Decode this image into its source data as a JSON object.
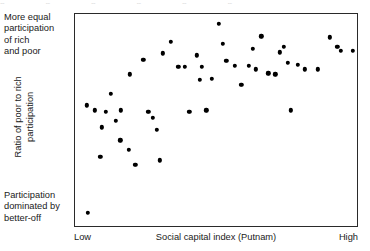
{
  "figure": {
    "top_crop_remnant": "p p p p p p",
    "y_axis": {
      "top_annotation": "More equal\nparticipation\nof rich\nand poor",
      "bottom_annotation": "Participation\ndominated by\nbetter-off",
      "rotated_title": "Ratio of poor to rich\nparticipation"
    },
    "x_axis": {
      "title": "Social capital index (Putnam)",
      "tick_low": "Low",
      "tick_high": "High"
    },
    "colors": {
      "frame": "#2a2a2a",
      "marker": "#000000",
      "text": "#1a1a1a",
      "background": "#ffffff"
    }
  },
  "chart_data": {
    "type": "scatter",
    "title": "",
    "xlabel": "Social capital index (Putnam)",
    "ylabel": "Ratio of poor to rich participation",
    "grid": false,
    "legend": false,
    "xlim": [
      0,
      100
    ],
    "ylim": [
      0,
      100
    ],
    "xtick_labels": [
      "Low",
      "High"
    ],
    "ytick_labels": [],
    "y_axis_annotations": {
      "high_end": "More equal participation of rich and poor",
      "low_end": "Participation dominated by better-off"
    },
    "series": [
      {
        "name": "US states",
        "marker": "dot",
        "color": "#000000",
        "points": [
          [
            4.2,
            57.0
          ],
          [
            4.6,
            6.2
          ],
          [
            7.0,
            54.5
          ],
          [
            9.5,
            46.5
          ],
          [
            11.0,
            54.0
          ],
          [
            12.6,
            62.5
          ],
          [
            14.4,
            49.5
          ],
          [
            16.2,
            54.5
          ],
          [
            19.4,
            71.5
          ],
          [
            24.2,
            78.5
          ],
          [
            26.0,
            54.0
          ],
          [
            27.6,
            51.0
          ],
          [
            29.0,
            45.5
          ],
          [
            31.2,
            81.5
          ],
          [
            34.0,
            87.0
          ],
          [
            36.6,
            75.0
          ],
          [
            39.0,
            75.0
          ],
          [
            40.6,
            54.0
          ],
          [
            43.2,
            80.5
          ],
          [
            44.2,
            69.0
          ],
          [
            45.0,
            75.0
          ],
          [
            46.6,
            54.5
          ],
          [
            48.6,
            69.5
          ],
          [
            51.0,
            95.5
          ],
          [
            52.4,
            86.0
          ],
          [
            53.6,
            78.0
          ],
          [
            56.6,
            75.5
          ],
          [
            59.0,
            66.5
          ],
          [
            61.6,
            75.5
          ],
          [
            63.0,
            83.5
          ],
          [
            64.2,
            74.0
          ],
          [
            66.0,
            89.5
          ],
          [
            68.6,
            72.0
          ],
          [
            71.0,
            71.5
          ],
          [
            72.6,
            82.0
          ],
          [
            74.0,
            84.5
          ],
          [
            75.4,
            77.0
          ],
          [
            76.6,
            54.5
          ],
          [
            79.0,
            76.0
          ],
          [
            81.4,
            74.0
          ],
          [
            86.0,
            74.0
          ],
          [
            90.4,
            89.0
          ],
          [
            93.0,
            84.5
          ],
          [
            94.2,
            82.5
          ],
          [
            98.5,
            82.5
          ],
          [
            19.0,
            36.0
          ],
          [
            21.4,
            29.0
          ],
          [
            30.0,
            31.0
          ],
          [
            16.0,
            40.5
          ],
          [
            9.0,
            32.5
          ]
        ]
      }
    ],
    "relationship": "positive, saturating at higher social capital"
  }
}
